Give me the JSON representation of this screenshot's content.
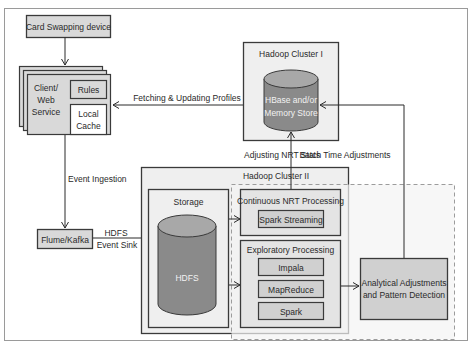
{
  "diagram": {
    "title": "",
    "colors": {
      "frame": "#9a9a9a",
      "box_fill": "#d9d9d9",
      "box_stroke": "#3a3a3a",
      "panel_fill": "#efefef",
      "cylinder_fill": "#8a8a8a",
      "cylinder_top": "#a8a8a8",
      "dashed": "#9c9c9c",
      "text": "#2a2a2a"
    },
    "nodes": {
      "card_device": "Card Swapping device",
      "client_web_service": [
        "Client/",
        "Web",
        "Service"
      ],
      "rules": "Rules",
      "local_cache": [
        "Local",
        "Cache"
      ],
      "flume_kafka": "Flume/Kafka",
      "hadoop_cluster_1": "Hadoop Cluster I",
      "hbase_store": [
        "HBase and/or",
        "Memory Store"
      ],
      "hadoop_cluster_2": "Hadoop Cluster II",
      "storage": "Storage",
      "hdfs": "HDFS",
      "continuous_nrt": "Continuous NRT Processing",
      "spark_streaming": "Spark Streaming",
      "exploratory": "Exploratory Processing",
      "impala": "Impala",
      "mapreduce": "MapReduce",
      "spark": "Spark",
      "analytical": [
        "Analytical Adjustments",
        "and Pattern Detection"
      ]
    },
    "edges": {
      "fetching_updating": "Fetching & Updating Profiles",
      "event_ingestion": "Event Ingestion",
      "hdfs_event_sink": [
        "HDFS",
        "Event Sink"
      ],
      "adjusting_nrt": "Adjusting NRT Stats",
      "batch_time": "Batch Time Adjustments"
    }
  }
}
